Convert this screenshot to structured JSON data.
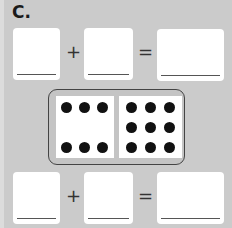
{
  "problem": {
    "label": "C."
  },
  "equations": [
    {
      "operator1": "+",
      "operator2": "=",
      "addend1": "",
      "addend2": "",
      "sum": ""
    },
    {
      "operator1": "+",
      "operator2": "=",
      "addend1": "",
      "addend2": "",
      "sum": ""
    }
  ],
  "domino": {
    "left_dots": 6,
    "right_dots": 9
  }
}
